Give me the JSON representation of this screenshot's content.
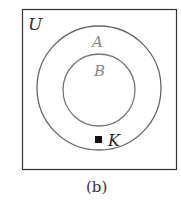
{
  "diagram": {
    "universe_label": "U",
    "sets": [
      {
        "label": "A",
        "role": "outer"
      },
      {
        "label": "B",
        "role": "inner"
      }
    ],
    "point": {
      "label": "K",
      "region": "A but not B"
    },
    "caption": "(b)",
    "colors": {
      "frame": "#333333",
      "circles": "#666666",
      "set_labels": "#888888",
      "point": "#111111"
    }
  }
}
